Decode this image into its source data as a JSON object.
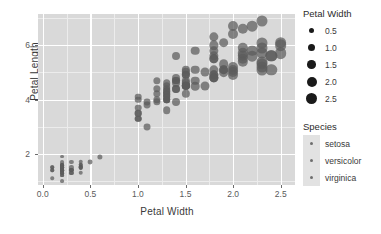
{
  "chart_data": {
    "type": "scatter",
    "title": "",
    "xlabel": "Petal Width",
    "ylabel": "Petal Length",
    "xlim": [
      -0.05,
      2.65
    ],
    "ylim": [
      0.85,
      7.15
    ],
    "xticks": [
      "0.0",
      "0.5",
      "1.0",
      "1.5",
      "2.0",
      "2.5"
    ],
    "xtick_values": [
      0.0,
      0.5,
      1.0,
      1.5,
      2.0,
      2.5
    ],
    "yticks": [
      "2",
      "4",
      "6"
    ],
    "ytick_values": [
      2,
      4,
      6
    ],
    "grid": true,
    "legend_position": "right",
    "panel_background": "#d9d9d9",
    "grid_color": "#ffffff",
    "point_color": "#5c5c5c",
    "size_encoding": "Petal Width",
    "color_encoding": "Species",
    "series": [
      {
        "name": "setosa",
        "points": [
          [
            0.2,
            1.4
          ],
          [
            0.2,
            1.4
          ],
          [
            0.2,
            1.3
          ],
          [
            0.2,
            1.5
          ],
          [
            0.2,
            1.4
          ],
          [
            0.4,
            1.7
          ],
          [
            0.3,
            1.4
          ],
          [
            0.2,
            1.5
          ],
          [
            0.2,
            1.4
          ],
          [
            0.1,
            1.5
          ],
          [
            0.2,
            1.5
          ],
          [
            0.2,
            1.6
          ],
          [
            0.1,
            1.4
          ],
          [
            0.1,
            1.1
          ],
          [
            0.2,
            1.2
          ],
          [
            0.4,
            1.5
          ],
          [
            0.4,
            1.3
          ],
          [
            0.3,
            1.4
          ],
          [
            0.3,
            1.7
          ],
          [
            0.3,
            1.5
          ],
          [
            0.2,
            1.7
          ],
          [
            0.4,
            1.5
          ],
          [
            0.2,
            1.0
          ],
          [
            0.5,
            1.7
          ],
          [
            0.2,
            1.9
          ],
          [
            0.2,
            1.6
          ],
          [
            0.4,
            1.6
          ],
          [
            0.2,
            1.5
          ],
          [
            0.2,
            1.4
          ],
          [
            0.2,
            1.6
          ],
          [
            0.2,
            1.6
          ],
          [
            0.4,
            1.5
          ],
          [
            0.1,
            1.5
          ],
          [
            0.2,
            1.4
          ],
          [
            0.2,
            1.5
          ],
          [
            0.2,
            1.2
          ],
          [
            0.2,
            1.3
          ],
          [
            0.1,
            1.4
          ],
          [
            0.2,
            1.3
          ],
          [
            0.2,
            1.5
          ],
          [
            0.3,
            1.3
          ],
          [
            0.3,
            1.3
          ],
          [
            0.2,
            1.3
          ],
          [
            0.6,
            1.9
          ],
          [
            0.4,
            1.6
          ],
          [
            0.3,
            1.4
          ],
          [
            0.2,
            1.6
          ],
          [
            0.2,
            1.4
          ],
          [
            0.2,
            1.5
          ],
          [
            0.2,
            1.4
          ]
        ]
      },
      {
        "name": "versicolor",
        "points": [
          [
            1.4,
            4.7
          ],
          [
            1.5,
            4.5
          ],
          [
            1.5,
            4.9
          ],
          [
            1.3,
            4.0
          ],
          [
            1.5,
            4.6
          ],
          [
            1.3,
            4.5
          ],
          [
            1.6,
            4.7
          ],
          [
            1.0,
            3.3
          ],
          [
            1.3,
            4.6
          ],
          [
            1.4,
            3.9
          ],
          [
            1.0,
            3.5
          ],
          [
            1.5,
            4.2
          ],
          [
            1.0,
            4.0
          ],
          [
            1.4,
            4.7
          ],
          [
            1.3,
            3.6
          ],
          [
            1.4,
            4.4
          ],
          [
            1.5,
            4.5
          ],
          [
            1.0,
            4.1
          ],
          [
            1.5,
            4.5
          ],
          [
            1.1,
            3.9
          ],
          [
            1.8,
            4.8
          ],
          [
            1.3,
            4.0
          ],
          [
            1.5,
            4.9
          ],
          [
            1.2,
            4.7
          ],
          [
            1.3,
            4.3
          ],
          [
            1.4,
            4.4
          ],
          [
            1.4,
            4.8
          ],
          [
            1.7,
            5.0
          ],
          [
            1.5,
            4.5
          ],
          [
            1.0,
            3.5
          ],
          [
            1.1,
            3.8
          ],
          [
            1.0,
            3.7
          ],
          [
            1.2,
            3.9
          ],
          [
            1.6,
            5.1
          ],
          [
            1.5,
            4.5
          ],
          [
            1.6,
            4.5
          ],
          [
            1.5,
            4.7
          ],
          [
            1.3,
            4.4
          ],
          [
            1.3,
            4.1
          ],
          [
            1.3,
            4.0
          ],
          [
            1.2,
            4.4
          ],
          [
            1.4,
            4.6
          ],
          [
            1.2,
            4.0
          ],
          [
            1.0,
            3.3
          ],
          [
            1.3,
            4.2
          ],
          [
            1.2,
            4.2
          ],
          [
            1.3,
            4.2
          ],
          [
            1.3,
            4.3
          ],
          [
            1.1,
            3.0
          ],
          [
            1.3,
            4.1
          ]
        ]
      },
      {
        "name": "virginica",
        "points": [
          [
            2.5,
            6.0
          ],
          [
            1.9,
            5.1
          ],
          [
            2.1,
            5.9
          ],
          [
            1.8,
            5.6
          ],
          [
            2.2,
            5.8
          ],
          [
            2.1,
            6.6
          ],
          [
            1.7,
            4.5
          ],
          [
            1.8,
            6.3
          ],
          [
            1.8,
            5.8
          ],
          [
            2.5,
            6.1
          ],
          [
            2.0,
            5.1
          ],
          [
            1.9,
            5.3
          ],
          [
            2.1,
            5.5
          ],
          [
            2.0,
            5.0
          ],
          [
            2.4,
            5.1
          ],
          [
            2.3,
            5.3
          ],
          [
            1.8,
            5.5
          ],
          [
            2.2,
            6.7
          ],
          [
            2.3,
            6.9
          ],
          [
            1.5,
            5.0
          ],
          [
            2.3,
            5.7
          ],
          [
            2.0,
            4.9
          ],
          [
            2.0,
            6.7
          ],
          [
            1.8,
            4.9
          ],
          [
            2.1,
            5.7
          ],
          [
            1.8,
            6.0
          ],
          [
            1.8,
            4.8
          ],
          [
            1.8,
            4.9
          ],
          [
            2.1,
            5.6
          ],
          [
            1.6,
            5.8
          ],
          [
            1.9,
            6.1
          ],
          [
            2.0,
            6.4
          ],
          [
            2.2,
            5.6
          ],
          [
            1.5,
            5.1
          ],
          [
            1.4,
            5.6
          ],
          [
            2.3,
            6.1
          ],
          [
            2.4,
            5.6
          ],
          [
            1.8,
            5.5
          ],
          [
            1.8,
            4.8
          ],
          [
            2.1,
            5.4
          ],
          [
            2.4,
            5.6
          ],
          [
            2.3,
            5.1
          ],
          [
            1.9,
            5.1
          ],
          [
            2.3,
            5.9
          ],
          [
            2.5,
            5.7
          ],
          [
            2.3,
            5.2
          ],
          [
            1.9,
            5.0
          ],
          [
            2.0,
            5.2
          ],
          [
            2.3,
            5.4
          ],
          [
            1.8,
            5.1
          ]
        ]
      }
    ]
  },
  "legends": {
    "size": {
      "title": "Petal Width",
      "items": [
        {
          "label": "0.5",
          "dot_px": 5
        },
        {
          "label": "1.0",
          "dot_px": 7
        },
        {
          "label": "1.5",
          "dot_px": 8.5
        },
        {
          "label": "2.0",
          "dot_px": 10
        },
        {
          "label": "2.5",
          "dot_px": 11.5
        }
      ]
    },
    "species": {
      "title": "Species",
      "items": [
        {
          "label": "setosa"
        },
        {
          "label": "versicolor"
        },
        {
          "label": "virginica"
        }
      ]
    }
  }
}
